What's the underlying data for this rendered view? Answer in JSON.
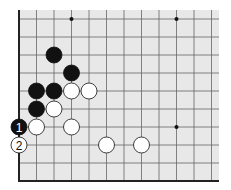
{
  "board": {
    "background": "#e8e8e8",
    "line_color": "#666666",
    "origin_x": 19,
    "origin_y": 19,
    "dx": 17.5,
    "dy": 18,
    "cols": 12,
    "rows": 10,
    "board_right": 219,
    "board_top": 10,
    "star_points": [
      [
        3,
        0
      ],
      [
        9,
        0
      ],
      [
        9,
        6
      ]
    ],
    "stones": [
      {
        "col": 2,
        "row": 2,
        "color": "black"
      },
      {
        "col": 3,
        "row": 3,
        "color": "black"
      },
      {
        "col": 1,
        "row": 4,
        "color": "black"
      },
      {
        "col": 2,
        "row": 4,
        "color": "black"
      },
      {
        "col": 3,
        "row": 4,
        "color": "white"
      },
      {
        "col": 4,
        "row": 4,
        "color": "white"
      },
      {
        "col": 1,
        "row": 5,
        "color": "black"
      },
      {
        "col": 2,
        "row": 5,
        "color": "white"
      },
      {
        "col": 0,
        "row": 6,
        "color": "black",
        "label": "1"
      },
      {
        "col": 1,
        "row": 6,
        "color": "white"
      },
      {
        "col": 3,
        "row": 6,
        "color": "white"
      },
      {
        "col": 0,
        "row": 7,
        "color": "white",
        "label": "2"
      },
      {
        "col": 5,
        "row": 7,
        "color": "white"
      },
      {
        "col": 7,
        "row": 7,
        "color": "white"
      }
    ]
  }
}
